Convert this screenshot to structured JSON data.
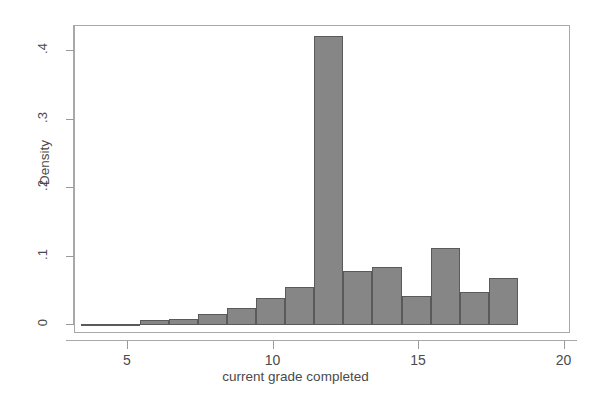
{
  "chart_data": {
    "type": "bar",
    "title": "",
    "subtitle": "",
    "xlabel": "current grade completed",
    "ylabel": "Density",
    "xlim": [
      3.4,
      20.4
    ],
    "ylim": [
      0,
      0.445
    ],
    "grid": false,
    "legend": null,
    "bar_style": {
      "fill": "#868686",
      "edge": "#5a5a5a",
      "bin_width": 1.0
    },
    "x_ticks": [
      5,
      10,
      15,
      20
    ],
    "x_tick_labels": [
      "5",
      "10",
      "15",
      "20"
    ],
    "y_ticks": [
      0,
      0.1,
      0.2,
      0.3,
      0.4
    ],
    "y_tick_labels": [
      "0",
      ".1",
      ".2",
      ".3",
      ".4"
    ],
    "bins": [
      {
        "bin_start": 3.4,
        "bin_end": 4.4,
        "center": 3.9,
        "value": 0.002
      },
      {
        "bin_start": 4.4,
        "bin_end": 5.4,
        "center": 4.9,
        "value": 0.002
      },
      {
        "bin_start": 5.4,
        "bin_end": 6.4,
        "center": 5.9,
        "value": 0.008
      },
      {
        "bin_start": 6.4,
        "bin_end": 7.4,
        "center": 6.9,
        "value": 0.009
      },
      {
        "bin_start": 7.4,
        "bin_end": 8.4,
        "center": 7.9,
        "value": 0.016
      },
      {
        "bin_start": 8.4,
        "bin_end": 9.4,
        "center": 8.9,
        "value": 0.025
      },
      {
        "bin_start": 9.4,
        "bin_end": 10.4,
        "center": 9.9,
        "value": 0.039
      },
      {
        "bin_start": 10.4,
        "bin_end": 11.4,
        "center": 10.9,
        "value": 0.055
      },
      {
        "bin_start": 11.4,
        "bin_end": 12.4,
        "center": 11.9,
        "value": 0.422
      },
      {
        "bin_start": 12.4,
        "bin_end": 13.4,
        "center": 12.9,
        "value": 0.079
      },
      {
        "bin_start": 13.4,
        "bin_end": 14.4,
        "center": 13.9,
        "value": 0.084
      },
      {
        "bin_start": 14.4,
        "bin_end": 15.4,
        "center": 14.9,
        "value": 0.042
      },
      {
        "bin_start": 15.4,
        "bin_end": 16.4,
        "center": 15.9,
        "value": 0.113
      },
      {
        "bin_start": 16.4,
        "bin_end": 17.4,
        "center": 16.9,
        "value": 0.048
      },
      {
        "bin_start": 17.4,
        "bin_end": 18.4,
        "center": 17.9,
        "value": 0.068
      }
    ],
    "categories": [
      "3.9",
      "4.9",
      "5.9",
      "6.9",
      "7.9",
      "8.9",
      "9.9",
      "10.9",
      "11.9",
      "12.9",
      "13.9",
      "14.9",
      "15.9",
      "16.9",
      "17.9"
    ],
    "values": [
      0.002,
      0.002,
      0.008,
      0.009,
      0.016,
      0.025,
      0.039,
      0.055,
      0.422,
      0.079,
      0.084,
      0.042,
      0.113,
      0.048,
      0.068
    ]
  }
}
